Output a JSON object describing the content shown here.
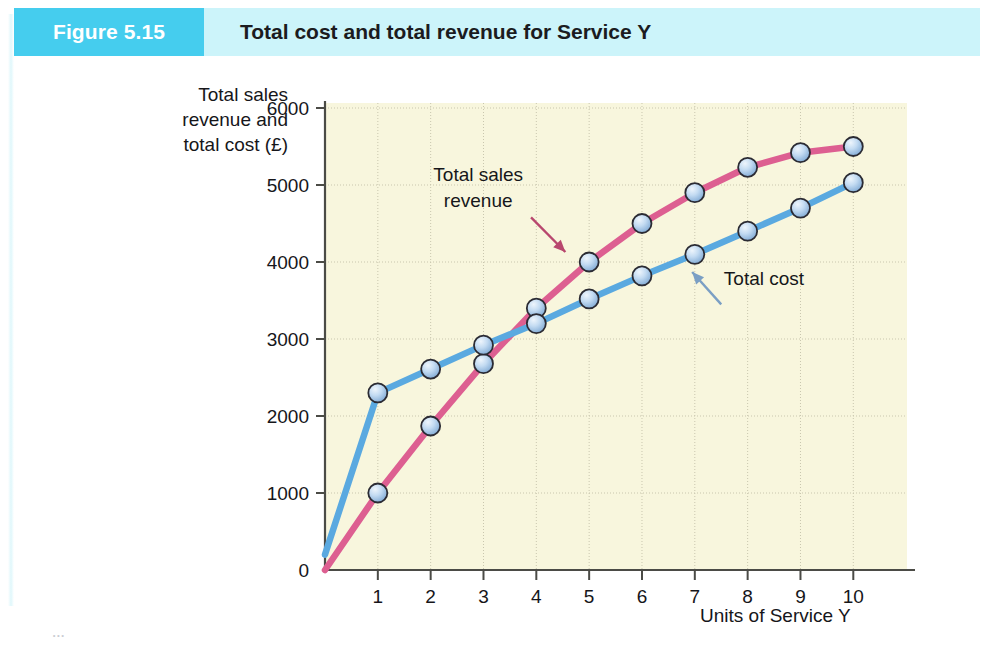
{
  "header": {
    "figure_number": "Figure 5.15",
    "title": "Total cost and total revenue for Service Y",
    "number_box_color": "#45cdee",
    "band_color": "#ccf4fa"
  },
  "chart_data": {
    "type": "line",
    "title": "Total cost and total revenue for Service Y",
    "xlabel": "Units of Service Y",
    "ylabel": "Total sales revenue and total cost (£)",
    "ylabel_lines": [
      "Total sales",
      "revenue and",
      "total cost (£)"
    ],
    "xlim": [
      0,
      10.6
    ],
    "ylim": [
      0,
      6000
    ],
    "x_ticks": [
      1,
      2,
      3,
      4,
      5,
      6,
      7,
      8,
      9,
      10
    ],
    "x_tick_labels": [
      "1",
      "2",
      "3",
      "4",
      "5",
      "6",
      "7",
      "8",
      "9",
      "10"
    ],
    "y_ticks": [
      0,
      1000,
      2000,
      3000,
      4000,
      5000,
      6000
    ],
    "y_tick_labels": [
      "0",
      "1000",
      "2000",
      "3000",
      "4000",
      "5000",
      "6000"
    ],
    "grid": true,
    "legend": "none",
    "plot_background": "#f8f6dd",
    "x": [
      0,
      1,
      2,
      3,
      4,
      5,
      6,
      7,
      8,
      9,
      10
    ],
    "series": [
      {
        "name": "Total sales revenue",
        "color": "#dd5f91",
        "marker_face": "#aac9ea",
        "values": [
          0,
          1000,
          1870,
          2680,
          3400,
          4000,
          4500,
          4900,
          5230,
          5420,
          5500
        ],
        "markers_from_index": 1
      },
      {
        "name": "Total cost",
        "color": "#5aa9e0",
        "marker_face": "#aac9ea",
        "values": [
          200,
          2300,
          2610,
          2920,
          3200,
          3520,
          3820,
          4100,
          4400,
          4700,
          5030
        ],
        "markers_from_index": 1
      }
    ],
    "annotations": [
      {
        "label": "Total sales revenue",
        "lines": [
          "Total sales",
          "revenue"
        ],
        "text_x": 2.9,
        "text_y": 5050,
        "arrow_color": "#b8476e",
        "arrow_from": [
          3.9,
          4580
        ],
        "arrow_to": [
          4.55,
          4130
        ]
      },
      {
        "label": "Total cost",
        "lines": [
          "Total cost"
        ],
        "text_x": 7.55,
        "text_y": 3700,
        "arrow_color": "#7b9fc4",
        "arrow_from": [
          7.5,
          3450
        ],
        "arrow_to": [
          6.95,
          3870
        ]
      }
    ]
  },
  "page_bleed": {
    "text": "..."
  }
}
